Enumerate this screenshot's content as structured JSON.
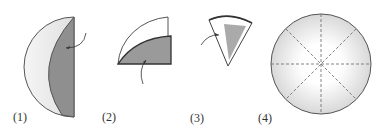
{
  "steps": [
    {
      "label": "(1)",
      "description": "Fold circle in half"
    },
    {
      "label": "(2)",
      "description": "Fold into quarter"
    },
    {
      "label": "(3)",
      "description": "Fold into eighth"
    },
    {
      "label": "(4)",
      "description": "Unfolded circle with crease lines"
    }
  ],
  "colors": {
    "shaded": "#8f8f8f",
    "light": "#ececec",
    "outline": "#444444"
  }
}
